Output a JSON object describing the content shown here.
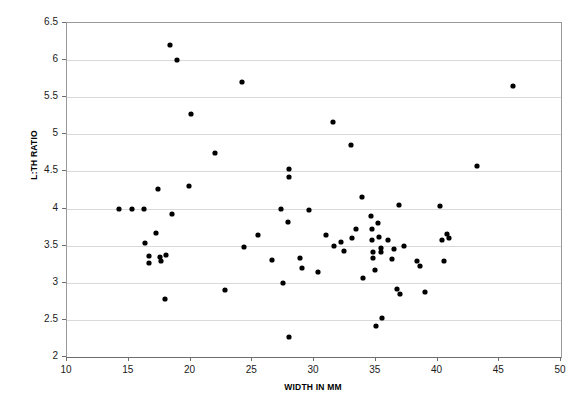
{
  "chart_data": {
    "type": "scatter",
    "title": "",
    "xlabel": "WIDTH IN MM",
    "ylabel": "L:TH RATIO",
    "xlim": [
      10,
      50
    ],
    "ylim": [
      2,
      6.5
    ],
    "xticks": [
      10,
      15,
      20,
      25,
      30,
      35,
      40,
      45,
      50
    ],
    "xtick_labels": [
      "10",
      "15",
      "20",
      "25",
      "30",
      "35",
      "40",
      "45",
      "50"
    ],
    "yticks": [
      2,
      2.5,
      3,
      3.5,
      4,
      4.5,
      5,
      5.5,
      6,
      6.5
    ],
    "ytick_labels": [
      "2",
      "2.5",
      "3",
      "3.5",
      "4",
      "4.5",
      "5",
      "5.5",
      "6",
      "6.5"
    ],
    "grid": "horizontal",
    "legend": "none",
    "marker": "filled-diamond",
    "marker_color": "#000000",
    "series": [
      {
        "name": "specimens",
        "points": [
          [
            14.2,
            4.0
          ],
          [
            15.3,
            4.0
          ],
          [
            16.2,
            4.0
          ],
          [
            16.3,
            3.53
          ],
          [
            16.6,
            3.36
          ],
          [
            16.6,
            3.27
          ],
          [
            17.2,
            3.67
          ],
          [
            17.4,
            4.26
          ],
          [
            17.5,
            3.35
          ],
          [
            17.6,
            3.3
          ],
          [
            17.9,
            2.78
          ],
          [
            18.0,
            3.38
          ],
          [
            18.3,
            6.2
          ],
          [
            18.5,
            3.92
          ],
          [
            18.9,
            6.0
          ],
          [
            19.9,
            4.3
          ],
          [
            20.0,
            5.27
          ],
          [
            22.0,
            4.75
          ],
          [
            22.8,
            2.9
          ],
          [
            24.2,
            5.7
          ],
          [
            24.3,
            3.48
          ],
          [
            25.5,
            3.65
          ],
          [
            26.6,
            3.31
          ],
          [
            27.3,
            4.0
          ],
          [
            27.5,
            3.0
          ],
          [
            27.9,
            3.82
          ],
          [
            28.0,
            4.53
          ],
          [
            28.0,
            4.43
          ],
          [
            28.0,
            2.27
          ],
          [
            28.9,
            3.33
          ],
          [
            29.0,
            3.2
          ],
          [
            29.6,
            3.98
          ],
          [
            30.3,
            3.15
          ],
          [
            31.0,
            3.65
          ],
          [
            31.5,
            5.17
          ],
          [
            31.6,
            3.5
          ],
          [
            32.2,
            3.55
          ],
          [
            32.4,
            3.43
          ],
          [
            33.0,
            4.85
          ],
          [
            33.1,
            3.6
          ],
          [
            33.4,
            3.73
          ],
          [
            33.9,
            4.16
          ],
          [
            34.0,
            3.06
          ],
          [
            34.6,
            3.9
          ],
          [
            34.7,
            3.72
          ],
          [
            34.7,
            3.57
          ],
          [
            34.8,
            3.42
          ],
          [
            34.8,
            3.33
          ],
          [
            34.9,
            3.17
          ],
          [
            35.0,
            2.42
          ],
          [
            35.2,
            3.8
          ],
          [
            35.3,
            3.62
          ],
          [
            35.4,
            3.47
          ],
          [
            35.4,
            3.41
          ],
          [
            35.5,
            2.53
          ],
          [
            36.0,
            3.57
          ],
          [
            36.3,
            3.32
          ],
          [
            36.5,
            3.45
          ],
          [
            36.7,
            2.92
          ],
          [
            36.9,
            4.05
          ],
          [
            37.0,
            2.85
          ],
          [
            37.3,
            3.5
          ],
          [
            38.3,
            3.3
          ],
          [
            38.6,
            3.22
          ],
          [
            39.0,
            2.87
          ],
          [
            40.2,
            4.04
          ],
          [
            40.4,
            3.57
          ],
          [
            40.5,
            3.3
          ],
          [
            40.8,
            3.66
          ],
          [
            40.9,
            3.6
          ],
          [
            43.2,
            4.57
          ],
          [
            46.1,
            5.65
          ]
        ]
      }
    ]
  }
}
